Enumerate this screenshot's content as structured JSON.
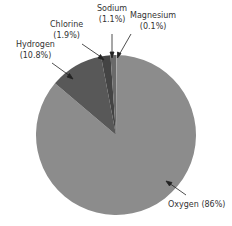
{
  "chart_data": {
    "type": "pie",
    "title": "",
    "start_angle": "top",
    "direction": "clockwise",
    "slices": [
      {
        "name": "Magnesium",
        "value": 0.1,
        "label_line1": "Magnesium",
        "label_line2": "(0.1%)",
        "color": "#b0b0b0"
      },
      {
        "name": "Oxygen",
        "value": 86,
        "label_line1": "Oxygen (86%)",
        "label_line2": "",
        "color": "#8c8c8c"
      },
      {
        "name": "Hydrogen",
        "value": 10.8,
        "label_line1": "Hydrogen",
        "label_line2": "(10.8%)",
        "color": "#585858"
      },
      {
        "name": "Chlorine",
        "value": 1.9,
        "label_line1": "Chlorine",
        "label_line2": "(1.9%)",
        "color": "#444444"
      },
      {
        "name": "Sodium",
        "value": 1.1,
        "label_line1": "Sodium",
        "label_line2": "(1.1%)",
        "color": "#6a6a6a"
      }
    ],
    "geometry": {
      "cx": 116,
      "cy": 135,
      "r": 80
    }
  },
  "labels": {
    "sodium": {
      "l1": "Sodium",
      "l2": "(1.1%)"
    },
    "magnesium": {
      "l1": "Magnesium",
      "l2": "(0.1%)"
    },
    "chlorine": {
      "l1": "Chlorine",
      "l2": "(1.9%)"
    },
    "hydrogen": {
      "l1": "Hydrogen",
      "l2": "(10.8%)"
    },
    "oxygen": {
      "l1": "Oxygen (86%)"
    }
  }
}
